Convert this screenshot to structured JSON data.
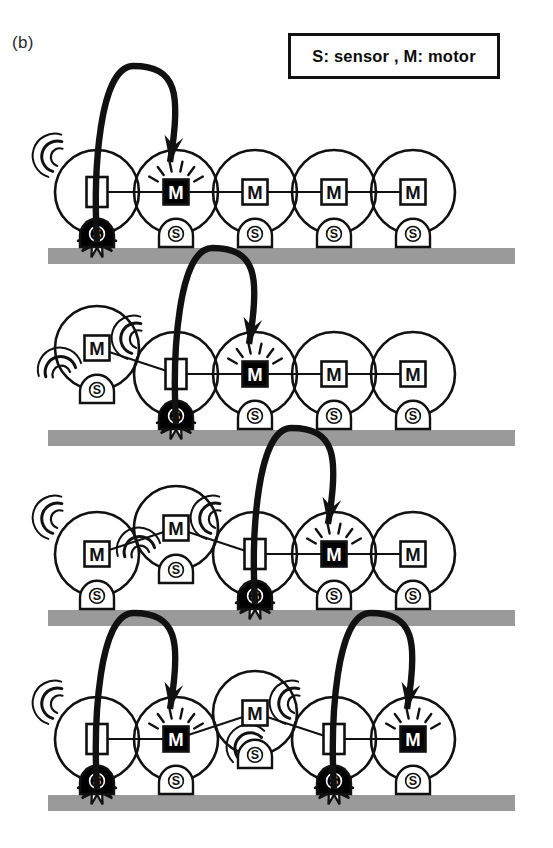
{
  "figure": {
    "panel_label": "(b)",
    "legend": {
      "text": "S: sensor ,  M: motor",
      "sensor_key": "S",
      "sensor_meaning": "sensor",
      "motor_key": "M",
      "motor_meaning": "motor"
    },
    "module_labels": {
      "motor": "M",
      "sensor": "S",
      "idle": ""
    },
    "colors": {
      "ink": "#111111",
      "ground": "#9a9a9a",
      "active_fill": "#000000",
      "inactive_fill": "#ffffff",
      "page": "#ffffff"
    },
    "geometry": {
      "circle_radius": 42,
      "module_spacing": 79,
      "first_center_x": 97,
      "ground_left": 48,
      "ground_right": 515,
      "ground_thickness": 16
    },
    "rows": [
      {
        "index": 1,
        "caption": "Step 1",
        "ground_y": 248,
        "modules": [
          {
            "id": "r1m1",
            "slot": 1,
            "box": "idle",
            "box_label": "",
            "box_shape": "tall",
            "box_state": "inactive",
            "sensor": "contact",
            "sensor_label": "S",
            "lifted": false,
            "vibrating": true,
            "vibration_side": "top-left",
            "sparkle": false
          },
          {
            "id": "r1m2",
            "slot": 2,
            "box": "motor",
            "box_label": "M",
            "box_shape": "square",
            "box_state": "active",
            "sensor": "idle",
            "sensor_label": "S",
            "lifted": false,
            "vibrating": false,
            "vibration_side": "",
            "sparkle": true
          },
          {
            "id": "r1m3",
            "slot": 3,
            "box": "motor",
            "box_label": "M",
            "box_shape": "square",
            "box_state": "inactive",
            "sensor": "idle",
            "sensor_label": "S",
            "lifted": false,
            "vibrating": false,
            "vibration_side": "",
            "sparkle": false
          },
          {
            "id": "r1m4",
            "slot": 4,
            "box": "motor",
            "box_label": "M",
            "box_shape": "square",
            "box_state": "inactive",
            "sensor": "idle",
            "sensor_label": "S",
            "lifted": false,
            "vibrating": false,
            "vibration_side": "",
            "sparkle": false
          },
          {
            "id": "r1m5",
            "slot": 5,
            "box": "motor",
            "box_label": "M",
            "box_shape": "square",
            "box_state": "inactive",
            "sensor": "idle",
            "sensor_label": "S",
            "lifted": false,
            "vibrating": false,
            "vibration_side": "",
            "sparkle": false
          }
        ],
        "signals": [
          {
            "from_slot": 1,
            "to_slot": 2
          }
        ]
      },
      {
        "index": 2,
        "caption": "Step 2",
        "ground_y": 430,
        "modules": [
          {
            "id": "r2m1",
            "slot": 1,
            "box": "motor",
            "box_label": "M",
            "box_shape": "square",
            "box_state": "inactive",
            "sensor": "idle",
            "sensor_label": "S",
            "lifted": true,
            "vibrating": true,
            "vibration_side": "bottom-left",
            "sparkle": false
          },
          {
            "id": "r2m2",
            "slot": 2,
            "box": "idle",
            "box_label": "",
            "box_shape": "tall",
            "box_state": "inactive",
            "sensor": "contact",
            "sensor_label": "S",
            "lifted": false,
            "vibrating": true,
            "vibration_side": "top-left",
            "sparkle": false
          },
          {
            "id": "r2m3",
            "slot": 3,
            "box": "motor",
            "box_label": "M",
            "box_shape": "square",
            "box_state": "active",
            "sensor": "idle",
            "sensor_label": "S",
            "lifted": false,
            "vibrating": false,
            "vibration_side": "",
            "sparkle": true
          },
          {
            "id": "r2m4",
            "slot": 4,
            "box": "motor",
            "box_label": "M",
            "box_shape": "square",
            "box_state": "inactive",
            "sensor": "idle",
            "sensor_label": "S",
            "lifted": false,
            "vibrating": false,
            "vibration_side": "",
            "sparkle": false
          },
          {
            "id": "r2m5",
            "slot": 5,
            "box": "motor",
            "box_label": "M",
            "box_shape": "square",
            "box_state": "inactive",
            "sensor": "idle",
            "sensor_label": "S",
            "lifted": false,
            "vibrating": false,
            "vibration_side": "",
            "sparkle": false
          }
        ],
        "signals": [
          {
            "from_slot": 2,
            "to_slot": 3
          }
        ]
      },
      {
        "index": 3,
        "caption": "Step 3",
        "ground_y": 610,
        "modules": [
          {
            "id": "r3m1",
            "slot": 1,
            "box": "motor",
            "box_label": "M",
            "box_shape": "square",
            "box_state": "inactive",
            "sensor": "idle",
            "sensor_label": "S",
            "lifted": false,
            "vibrating": true,
            "vibration_side": "top-left",
            "sparkle": false
          },
          {
            "id": "r3m2",
            "slot": 2,
            "box": "motor",
            "box_label": "M",
            "box_shape": "square",
            "box_state": "inactive",
            "sensor": "idle",
            "sensor_label": "S",
            "lifted": true,
            "vibrating": true,
            "vibration_side": "bottom-left",
            "sparkle": false
          },
          {
            "id": "r3m3",
            "slot": 3,
            "box": "idle",
            "box_label": "",
            "box_shape": "tall",
            "box_state": "inactive",
            "sensor": "contact",
            "sensor_label": "S",
            "lifted": false,
            "vibrating": true,
            "vibration_side": "top-left",
            "sparkle": false
          },
          {
            "id": "r3m4",
            "slot": 4,
            "box": "motor",
            "box_label": "M",
            "box_shape": "square",
            "box_state": "active",
            "sensor": "idle",
            "sensor_label": "S",
            "lifted": false,
            "vibrating": false,
            "vibration_side": "",
            "sparkle": true
          },
          {
            "id": "r3m5",
            "slot": 5,
            "box": "motor",
            "box_label": "M",
            "box_shape": "square",
            "box_state": "inactive",
            "sensor": "idle",
            "sensor_label": "S",
            "lifted": false,
            "vibrating": false,
            "vibration_side": "",
            "sparkle": false
          }
        ],
        "signals": [
          {
            "from_slot": 3,
            "to_slot": 4
          }
        ]
      },
      {
        "index": 4,
        "caption": "Step 4",
        "ground_y": 795,
        "modules": [
          {
            "id": "r4m1",
            "slot": 1,
            "box": "idle",
            "box_label": "",
            "box_shape": "tall",
            "box_state": "inactive",
            "sensor": "contact",
            "sensor_label": "S",
            "lifted": false,
            "vibrating": true,
            "vibration_side": "top-left",
            "sparkle": false
          },
          {
            "id": "r4m2",
            "slot": 2,
            "box": "motor",
            "box_label": "M",
            "box_shape": "square",
            "box_state": "active",
            "sensor": "idle",
            "sensor_label": "S",
            "lifted": false,
            "vibrating": false,
            "vibration_side": "",
            "sparkle": true
          },
          {
            "id": "r4m3",
            "slot": 3,
            "box": "motor",
            "box_label": "M",
            "box_shape": "square",
            "box_state": "inactive",
            "sensor": "idle",
            "sensor_label": "S",
            "lifted": true,
            "vibrating": true,
            "vibration_side": "bottom-center",
            "sparkle": false
          },
          {
            "id": "r4m4",
            "slot": 4,
            "box": "idle",
            "box_label": "",
            "box_shape": "tall",
            "box_state": "inactive",
            "sensor": "contact",
            "sensor_label": "S",
            "lifted": false,
            "vibrating": true,
            "vibration_side": "top-left",
            "sparkle": false
          },
          {
            "id": "r4m5",
            "slot": 5,
            "box": "motor",
            "box_label": "M",
            "box_shape": "square",
            "box_state": "active",
            "sensor": "idle",
            "sensor_label": "S",
            "lifted": false,
            "vibrating": false,
            "vibration_side": "",
            "sparkle": true
          }
        ],
        "signals": [
          {
            "from_slot": 1,
            "to_slot": 2
          },
          {
            "from_slot": 4,
            "to_slot": 5
          }
        ]
      }
    ]
  }
}
